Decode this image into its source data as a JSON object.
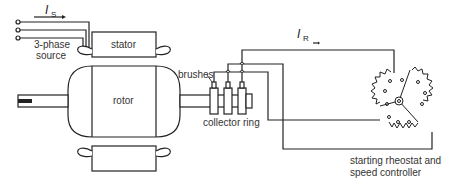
{
  "diagram": {
    "type": "wound-rotor induction motor",
    "labels": {
      "stator_current": "I",
      "stator_current_sub": "S",
      "rotor_current": "I",
      "rotor_current_sub": "R",
      "source_line1": "3-phase",
      "source_line2": "source",
      "stator": "stator",
      "rotor": "rotor",
      "brushes": "brushes",
      "collector_ring": "collector ring",
      "controller_line1": "starting rheostat and",
      "controller_line2": "speed controller"
    },
    "colors": {
      "line": "#222222",
      "text": "#333333",
      "background": "#ffffff"
    }
  }
}
